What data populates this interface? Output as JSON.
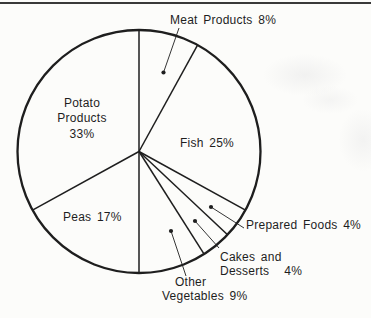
{
  "figure": {
    "kind": "scanned monochrome pie chart",
    "top_rule": true
  },
  "colors": {
    "ink": "#1e1e1e",
    "paper": "#fcfcfa"
  },
  "chart_data": {
    "type": "pie",
    "unit": "%",
    "direction": "clockwise",
    "start_angle_deg": 0,
    "total": 100,
    "fill": "none",
    "legend": "none",
    "slices": [
      {
        "name": "Meat Products",
        "value": 8,
        "label": "Meat Products 8%",
        "label_placement": "outside-top",
        "callout": true
      },
      {
        "name": "Fish",
        "value": 25,
        "label": "Fish 25%",
        "label_placement": "inside",
        "callout": false
      },
      {
        "name": "Prepared Foods",
        "value": 4,
        "label": "Prepared Foods 4%",
        "label_placement": "outside-right",
        "callout": true
      },
      {
        "name": "Cakes and Desserts",
        "value": 4,
        "label_lines": [
          "Cakes and",
          "Desserts",
          "4%"
        ],
        "label_placement": "outside-bottom-right",
        "callout": true
      },
      {
        "name": "Other Vegetables",
        "value": 9,
        "label_lines": [
          "Other",
          "Vegetables 9%"
        ],
        "label_placement": "outside-bottom",
        "callout": true
      },
      {
        "name": "Peas",
        "value": 17,
        "label": "Peas 17%",
        "label_placement": "inside",
        "callout": false
      },
      {
        "name": "Potato Products",
        "value": 33,
        "label_lines": [
          "Potato",
          "Products",
          "33%"
        ],
        "label_placement": "inside",
        "callout": false
      }
    ]
  }
}
